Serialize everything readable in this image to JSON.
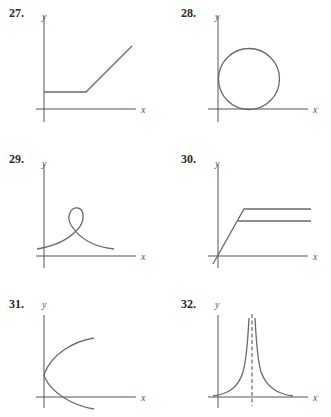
{
  "problems": [
    {
      "number": "27.",
      "x_label": "x",
      "y_label": "y",
      "description": "horizontal segment then increasing line"
    },
    {
      "number": "28.",
      "x_label": "x",
      "y_label": "y",
      "description": "circle tangent to both axes"
    },
    {
      "number": "29.",
      "x_label": "x",
      "y_label": "y",
      "description": "curve with a loop"
    },
    {
      "number": "30.",
      "x_label": "x",
      "y_label": "y",
      "description": "line rising to two horizontal branches"
    },
    {
      "number": "31.",
      "x_label": "x",
      "y_label": "y",
      "description": "sideways parabola opening right"
    },
    {
      "number": "32.",
      "x_label": "x",
      "y_label": "y",
      "description": "curve with vertical asymptote (dashed)"
    }
  ]
}
